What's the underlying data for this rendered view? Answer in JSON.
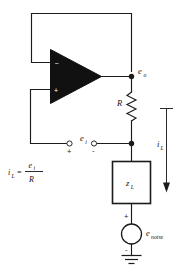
{
  "diagram": {
    "type": "circuit-schematic",
    "background_color": "#ffffff",
    "line_color": "#1b1b1b"
  },
  "opamp": {
    "name": "operational-amplifier",
    "fill_color": "#111111",
    "inverting_input_sign": "−",
    "noninverting_input_sign": "+"
  },
  "labels": {
    "output_node": "e",
    "output_node_sub": "o",
    "resistor": "R",
    "load": "z",
    "load_sub": "L",
    "load_current": "i",
    "load_current_sub": "L",
    "input_voltage": "e",
    "input_voltage_sub": "i",
    "noise_source": "e",
    "noise_source_sub": "noise"
  },
  "terminals": {
    "positive_sign": "+",
    "negative_sign": "-",
    "source_positive_sign": "+",
    "source_negative_sign": "-"
  },
  "equation": {
    "lhs": "i",
    "lhs_sub": "L",
    "equals": "=",
    "numerator": "e",
    "numerator_sub": "i",
    "denominator": "R"
  }
}
